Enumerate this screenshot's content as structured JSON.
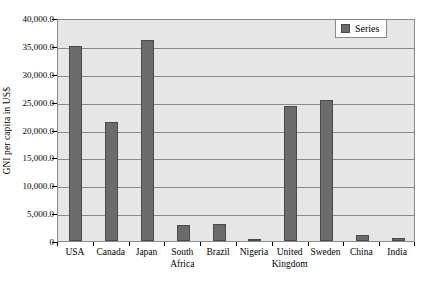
{
  "chart_data": {
    "type": "bar",
    "title": "",
    "xlabel": "",
    "ylabel": "GNI per capita in US$",
    "ylim": [
      0,
      40000
    ],
    "ytick_interval": 5000,
    "grid": true,
    "legend_position": "top-right",
    "legend": [
      "Series"
    ],
    "categories": [
      "USA",
      "Canada",
      "Japan",
      "South\nAfrica",
      "Brazil",
      "Nigeria",
      "United\nKingdom",
      "Sweden",
      "China",
      "India"
    ],
    "series": [
      {
        "name": "Series",
        "values": [
          34900,
          21400,
          36000,
          2900,
          3100,
          350,
          24200,
          25300,
          1100,
          500
        ]
      }
    ],
    "ytick_labels": [
      "40,000.0",
      "35,000.0",
      "30,000.0",
      "25,000.0",
      "20,000.0",
      "15,000.0",
      "10,000.0",
      "5,000.0",
      "0"
    ],
    "ytick_values": [
      40000,
      35000,
      30000,
      25000,
      20000,
      15000,
      10000,
      5000,
      0
    ],
    "colors": {
      "bar_fill": "#6b6b6b",
      "bar_stroke": "#4a4a4a",
      "plot_background": "#e6e6e6",
      "gridline": "#8a8a8a",
      "axis": "#000000",
      "page_background": "#ffffff"
    }
  }
}
